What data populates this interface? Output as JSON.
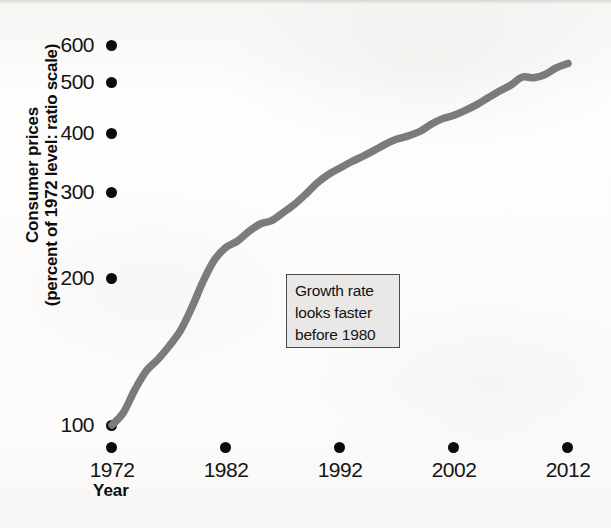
{
  "figure": {
    "kind": "scanned-textbook-figure",
    "line_color": "#7b7b7b",
    "tick_dot_color": "#0b0b0b",
    "annotation_fill": "#e9e8e6",
    "annotation_border": "#4a4a4a",
    "page_background": "#fdfdfc"
  },
  "axes": {
    "y_title_line1": "Consumer prices",
    "y_title_line2": "(percent of 1972 level: ratio scale)",
    "x_title": "Year",
    "y_ticks": [
      "600",
      "500",
      "400",
      "300",
      "200",
      "100"
    ],
    "x_ticks": [
      "1972",
      "1982",
      "1992",
      "2002",
      "2012"
    ]
  },
  "annotation": {
    "line1": "Growth rate",
    "line2": "looks faster",
    "line3": "before 1980"
  },
  "chart_data": {
    "type": "line",
    "title": "",
    "subtitle": "",
    "xlabel": "Year",
    "ylabel": "Consumer prices (percent of 1972 level: ratio scale)",
    "yscale": "log",
    "ylim": [
      88,
      660
    ],
    "xlim": [
      1972,
      2013
    ],
    "grid": false,
    "legend": null,
    "y_tick_values": [
      100,
      200,
      300,
      400,
      500,
      600
    ],
    "x_tick_values": [
      1972,
      1982,
      1992,
      2002,
      2012
    ],
    "annotations": [
      {
        "text": "Growth rate looks faster before 1980",
        "x": 1992,
        "y": 245,
        "style": "boxed"
      }
    ],
    "series": [
      {
        "name": "Consumer prices (1972 = 100)",
        "color": "#7b7b7b",
        "x": [
          1972,
          1973,
          1974,
          1975,
          1976,
          1977,
          1978,
          1979,
          1980,
          1981,
          1982,
          1983,
          1984,
          1985,
          1986,
          1987,
          1988,
          1989,
          1990,
          1991,
          1992,
          1993,
          1994,
          1995,
          1996,
          1997,
          1998,
          1999,
          2000,
          2001,
          2002,
          2003,
          2004,
          2005,
          2006,
          2007,
          2008,
          2009,
          2010,
          2011,
          2012
        ],
        "y": [
          100,
          106,
          118,
          129,
          136,
          145,
          156,
          174,
          197,
          218,
          231,
          238,
          249,
          258,
          262,
          272,
          283,
          297,
          313,
          326,
          336,
          346,
          355,
          365,
          376,
          385,
          391,
          399,
          413,
          424,
          431,
          441,
          453,
          468,
          483,
          497,
          516,
          514,
          522,
          539,
          550
        ]
      }
    ]
  }
}
